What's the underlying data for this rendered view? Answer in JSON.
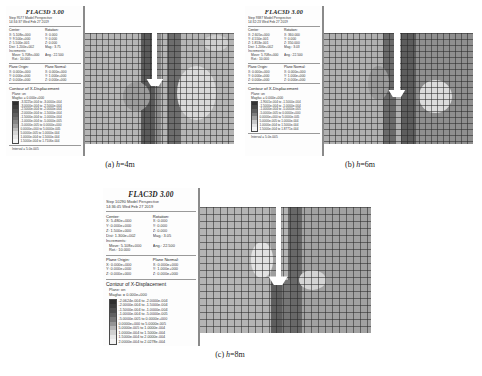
{
  "figure": {
    "panels": [
      {
        "key": "a",
        "caption_label": "(a)",
        "caption_var": "h",
        "caption_value": "=4m",
        "brand": "FLAC3D 3.00",
        "step_line": "Step 9577  Model Perspective",
        "time_line": "14:34:37 Wed Feb 27 2019",
        "center_head": "Center:",
        "rotation_head": "Rotation:",
        "center": [
          "X: 5.108e+000",
          "Y: 9.500e+000",
          "Z: 5.500e-001"
        ],
        "rotation": [
          "X:  0.000",
          "Y:  0.000",
          "Z:  0.000"
        ],
        "dist": "Dist: 1.200e+002",
        "mag": "Mag.:     3.75",
        "inc_head": "Increments:",
        "move": "Move: 5.708e+000",
        "ang": "Ang.:  22.500",
        "rot": "Rot.:   10.000",
        "plane_origin_head": "Plane Origin:",
        "plane_normal_head": "Plane Normal:",
        "plane_origin": [
          "X: 0.000e+000",
          "Y: 0.000e+000",
          "Z: 0.000e+000"
        ],
        "plane_normal": [
          "X: 0.000e+000",
          "Y: 1.000e+000",
          "Z: 0.000e+000"
        ],
        "contour_title": "Contour of X-Displacement",
        "plane_on": "Plane: on",
        "magfac": "Magfac =  0.000e+000",
        "legend": [
          {
            "color": "#2f2f2f",
            "label": "-3.3225e-004 to -3.0000e-004"
          },
          {
            "color": "#3d3d3d",
            "label": "-3.0000e-004 to -2.5000e-004"
          },
          {
            "color": "#4d4d4d",
            "label": "-2.5000e-004 to -2.0000e-004"
          },
          {
            "color": "#5e5e5e",
            "label": "-2.0000e-004 to -1.5000e-004"
          },
          {
            "color": "#707070",
            "label": "-1.5000e-004 to -1.0000e-004"
          },
          {
            "color": "#868686",
            "label": "-1.0000e-004 to -5.0000e-005"
          },
          {
            "color": "#9e9e9e",
            "label": "-5.0000e-005 to  0.0000e+000"
          },
          {
            "color": "#bcbcbc",
            "label": " 0.0000e+000 to  5.0000e-005"
          },
          {
            "color": "#d6d6d6",
            "label": " 5.0000e-005 to  1.0000e-004"
          },
          {
            "color": "#e8e8e8",
            "label": " 1.0000e-004 to  1.5000e-004"
          },
          {
            "color": "#f6f6f6",
            "label": " 1.5000e-004 to  1.7106e-004"
          }
        ],
        "interval": "Interval =  5.0e-005"
      },
      {
        "key": "b",
        "caption_label": "(b)",
        "caption_var": "h",
        "caption_value": "=6m",
        "brand": "FLAC3D 3.00",
        "step_line": "Step 9387  Model Perspective",
        "time_line": "14:32:23 Wed Feb 27 2019",
        "center_head": "Center:",
        "rotation_head": "Rotation:",
        "center": [
          "X: 2.605e+000",
          "Y: 4.550e-001",
          "Z: 1.853e-001"
        ],
        "rotation": [
          "X:  360.000",
          "Y:   0.000",
          "Z:  350.000"
        ],
        "dist": "Dist: 1.206e+002",
        "mag": "Mag.:     3.03",
        "inc_head": "Increments:",
        "move": "Move: 5.708e+000",
        "ang": "Ang.:  22.500",
        "rot": "Rot.:   10.000",
        "plane_origin_head": "Plane Origin:",
        "plane_normal_head": "Plane Normal:",
        "plane_origin": [
          "X: 0.000e+000",
          "Y: 0.000e+000",
          "Z: 0.000e+000"
        ],
        "plane_normal": [
          "X: 0.000e+000",
          "Y: 1.000e+000",
          "Z: 0.000e+000"
        ],
        "contour_title": "Contour of X-Displacement",
        "plane_on": "Plane: on",
        "magfac": "Magfac =  0.000e+000",
        "legend": [
          {
            "color": "#333333",
            "label": "-1.9001e-004 to -1.5000e-004"
          },
          {
            "color": "#474747",
            "label": "-1.5000e-004 to -1.0000e-004"
          },
          {
            "color": "#5e5e5e",
            "label": "-1.0000e-004 to -5.0000e-005"
          },
          {
            "color": "#7c7c7c",
            "label": "-5.0000e-005 to  0.0000e+000"
          },
          {
            "color": "#a0a0a0",
            "label": " 0.0000e+000 to  5.0000e-005"
          },
          {
            "color": "#c8c8c8",
            "label": " 5.0000e-005 to  1.0000e-004"
          },
          {
            "color": "#e4e4e4",
            "label": " 1.0000e-004 to  1.5000e-004"
          },
          {
            "color": "#f6f6f6",
            "label": " 1.5000e-004 to  1.8771e-004"
          }
        ],
        "interval": "Interval =  5.0e-005"
      },
      {
        "key": "c",
        "caption_label": "(c)",
        "caption_var": "h",
        "caption_value": "=8m",
        "brand": "FLAC3D 3.00",
        "step_line": "Step 10290  Model Perspective",
        "time_line": "14:36:45 Wed Feb 27 2019",
        "center_head": "Center:",
        "rotation_head": "Rotation:",
        "center": [
          "X: 5.480e+000",
          "Y: 0.000e+000",
          "Z: 1.500e+000"
        ],
        "rotation": [
          "X:  0.000",
          "Y:  0.000",
          "Z:  0.000"
        ],
        "dist": "Dist: 1.300e+002",
        "mag": "Mag.:     3.05",
        "inc_head": "Increments:",
        "move": "Move: 5.108e+000",
        "ang": "Ang.:  22.500",
        "rot": "Rot.:   10.000",
        "plane_origin_head": "Plane Origin:",
        "plane_normal_head": "Plane Normal:",
        "plane_origin": [
          "X: 0.000e+000",
          "Y: 0.000e+000",
          "Z: 0.000e+000"
        ],
        "plane_normal": [
          "X: 0.000e+000",
          "Y: 1.000e+000",
          "Z: 0.000e+000"
        ],
        "contour_title": "Contour of X-Displacement",
        "plane_on": "Plane: on",
        "magfac": "Magfac =  0.000e+000",
        "legend": [
          {
            "color": "#2e2e2e",
            "label": "-2.0624e-004 to -2.0000e-004"
          },
          {
            "color": "#3c3c3c",
            "label": "-2.0000e-004 to -1.5000e-004"
          },
          {
            "color": "#4d4d4d",
            "label": "-1.5000e-004 to -1.0000e-004"
          },
          {
            "color": "#616161",
            "label": "-1.0000e-004 to -5.0000e-005"
          },
          {
            "color": "#787878",
            "label": "-5.0000e-005 to  0.0000e+000"
          },
          {
            "color": "#949494",
            "label": " 0.0000e+000 to  5.0000e-005"
          },
          {
            "color": "#b4b4b4",
            "label": " 5.0000e-005 to  1.0000e-004"
          },
          {
            "color": "#d0d0d0",
            "label": " 1.0000e-004 to  1.5000e-004"
          },
          {
            "color": "#e6e6e6",
            "label": " 1.5000e-004 to  2.0000e-004"
          },
          {
            "color": "#f2f2f2",
            "label": " 2.0000e-004 to  2.0278e-004"
          }
        ],
        "interval": "Interval =  5.0e-005"
      }
    ]
  },
  "chart_data": {
    "type": "heatmap",
    "xlabel": "",
    "ylabel": "",
    "grid": true,
    "legend_position": "left-sidebar",
    "units": "m",
    "variable": "X-Displacement",
    "panels": [
      {
        "name": "(a) h=4m",
        "step": 9577,
        "contour_min": -0.00033225,
        "contour_max": 0.00017106,
        "interval": 5e-05,
        "levels": [
          -0.00033225,
          -0.0003,
          -0.00025,
          -0.0002,
          -0.00015,
          -0.0001,
          -5e-05,
          0.0,
          5e-05,
          0.0001,
          0.00015,
          0.00017106
        ]
      },
      {
        "name": "(b) h=6m",
        "step": 9387,
        "contour_min": -0.00019001,
        "contour_max": 0.00018771,
        "interval": 5e-05,
        "levels": [
          -0.00019001,
          -0.00015,
          -0.0001,
          -5e-05,
          0.0,
          5e-05,
          0.0001,
          0.00015,
          0.00018771
        ]
      },
      {
        "name": "(c) h=8m",
        "step": 10290,
        "contour_min": -0.00020624,
        "contour_max": 0.00020278,
        "interval": 5e-05,
        "levels": [
          -0.00020624,
          -0.0002,
          -0.00015,
          -0.0001,
          -5e-05,
          0.0,
          5e-05,
          0.0001,
          0.00015,
          0.0002,
          0.00020278
        ]
      }
    ]
  }
}
